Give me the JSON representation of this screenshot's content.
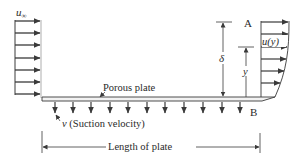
{
  "diagram": {
    "labels": {
      "free_stream": "u∞",
      "free_stream_base": "u",
      "free_stream_sub": "∞",
      "point_a": "A",
      "point_b": "B",
      "velocity_profile": "u(y)",
      "boundary_thickness": "δ",
      "height": "y",
      "plate": "Porous plate",
      "suction_symbol": "v",
      "suction_text": " (Suction velocity)",
      "length": "Length of plate"
    },
    "inflow_arrows": 7,
    "suction_arrows": 11,
    "profile_arrows": 7,
    "colors": {
      "line": "#3a3a3a",
      "plate_fill": "#f2f2f2",
      "text": "#2a2a2a"
    }
  }
}
